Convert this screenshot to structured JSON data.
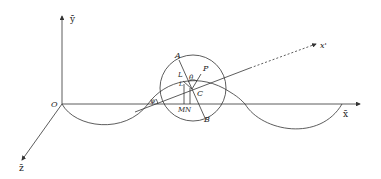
{
  "diagram": {
    "type": "geometry-3d-wave",
    "axes": {
      "x_label": "x̄",
      "y_label": "ȳ",
      "z_label": "z̄",
      "origin_label": "O",
      "rotated_axis_label": "x'"
    },
    "points": {
      "A": "A",
      "P": "P",
      "C": "C",
      "B": "B",
      "M": "M",
      "N": "N",
      "L": "L",
      "L2": "L"
    },
    "angles": {
      "psi": "ψ",
      "theta": "θ"
    },
    "colors": {
      "stroke": "#333333",
      "background": "#ffffff"
    }
  }
}
